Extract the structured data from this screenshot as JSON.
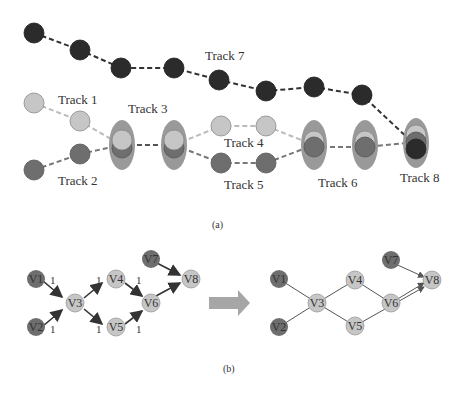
{
  "panel_a": {
    "caption": "(a)",
    "tracks": [
      "Track 1",
      "Track 2",
      "Track 3",
      "Track 4",
      "Track 5",
      "Track 6",
      "Track 7",
      "Track 8"
    ],
    "colors": {
      "dark": "#2b2b2b",
      "medium": "#6e6e6e",
      "light": "#c6c6c6",
      "ellipse": "#8c8c8c"
    }
  },
  "panel_b": {
    "caption": "(b)",
    "left_graph": {
      "nodes": [
        "V1",
        "V2",
        "V3",
        "V4",
        "V5",
        "V6",
        "V7",
        "V8"
      ],
      "edges": [
        {
          "from": "V1",
          "to": "V3",
          "weight": "1"
        },
        {
          "from": "V2",
          "to": "V3",
          "weight": "1"
        },
        {
          "from": "V3",
          "to": "V4",
          "weight": "1"
        },
        {
          "from": "V3",
          "to": "V5",
          "weight": "1"
        },
        {
          "from": "V4",
          "to": "V6",
          "weight": "1"
        },
        {
          "from": "V5",
          "to": "V6",
          "weight": "1"
        },
        {
          "from": "V6",
          "to": "V8",
          "weight": ""
        },
        {
          "from": "V7",
          "to": "V8",
          "weight": ""
        }
      ]
    },
    "right_graph": {
      "nodes": [
        "V1",
        "V2",
        "V3",
        "V4",
        "V5",
        "V6",
        "V7",
        "V8"
      ]
    }
  }
}
